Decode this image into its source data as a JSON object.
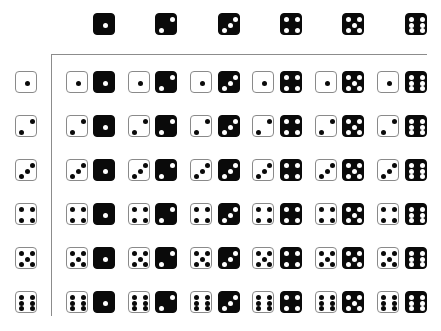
{
  "colors": {
    "white_die_face": "#ffffff",
    "white_die_border": "#8a8a8a",
    "black_die_face": "#0a0a0a",
    "axis_line": "#8c8c8c"
  },
  "column_header": {
    "die_color": "black",
    "values": [
      1,
      2,
      3,
      4,
      5,
      6
    ]
  },
  "row_header": {
    "die_color": "white",
    "values": [
      1,
      2,
      3,
      4,
      5,
      6
    ]
  },
  "grid": {
    "rows": [
      [
        [
          1,
          1
        ],
        [
          1,
          2
        ],
        [
          1,
          3
        ],
        [
          1,
          4
        ],
        [
          1,
          5
        ],
        [
          1,
          6
        ]
      ],
      [
        [
          2,
          1
        ],
        [
          2,
          2
        ],
        [
          2,
          3
        ],
        [
          2,
          4
        ],
        [
          2,
          5
        ],
        [
          2,
          6
        ]
      ],
      [
        [
          3,
          1
        ],
        [
          3,
          2
        ],
        [
          3,
          3
        ],
        [
          3,
          4
        ],
        [
          3,
          5
        ],
        [
          3,
          6
        ]
      ],
      [
        [
          4,
          1
        ],
        [
          4,
          2
        ],
        [
          4,
          3
        ],
        [
          4,
          4
        ],
        [
          4,
          5
        ],
        [
          4,
          6
        ]
      ],
      [
        [
          5,
          1
        ],
        [
          5,
          2
        ],
        [
          5,
          3
        ],
        [
          5,
          4
        ],
        [
          5,
          5
        ],
        [
          5,
          6
        ]
      ],
      [
        [
          6,
          1
        ],
        [
          6,
          2
        ],
        [
          6,
          3
        ],
        [
          6,
          4
        ],
        [
          6,
          5
        ],
        [
          6,
          6
        ]
      ]
    ],
    "cell_format": "[white_die_value, black_die_value]"
  },
  "layout": {
    "col_black_x": [
      93,
      155,
      218,
      280,
      342,
      405
    ],
    "col_white_x": [
      66,
      128,
      190,
      252,
      315,
      377
    ],
    "header_y": 13,
    "row_y": [
      71,
      115,
      159,
      203,
      247,
      291
    ],
    "row_header_x": 15
  }
}
